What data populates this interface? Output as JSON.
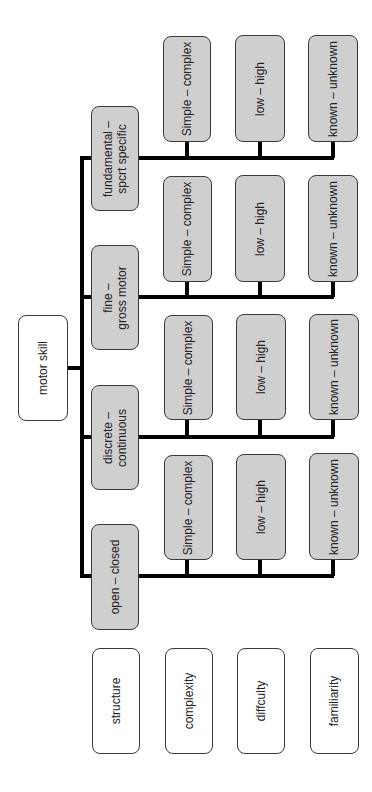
{
  "root": {
    "label": "motor skill"
  },
  "categories": [
    {
      "label": "fundamental –\nsport specific",
      "line1": "fundamental –",
      "line2": "spcrt specific"
    },
    {
      "label": "fine –\ngross motor",
      "line1": "fine –",
      "line2": "gross motor"
    },
    {
      "label": "discrete –\ncontinuous",
      "line1": "discrete –",
      "line2": "continuous"
    },
    {
      "label": "open – closed",
      "line1": "open – closed",
      "line2": ""
    }
  ],
  "dimension_values": {
    "complexity": "Simple – complex",
    "difficulty": "low – high",
    "familiarity": "known – unknown"
  },
  "legend": [
    {
      "label": "structure"
    },
    {
      "label": "complexity"
    },
    {
      "label": "diffculty"
    },
    {
      "label": "familiarity"
    }
  ],
  "colors": {
    "category_fill": "#cfcfcf",
    "legend_fill": "#ffffff",
    "connector": "#000000",
    "border": "#3a3a3a"
  }
}
